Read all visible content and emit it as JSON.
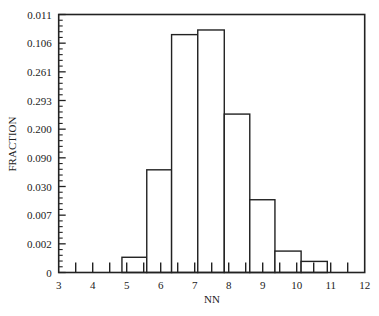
{
  "chart_data": {
    "type": "bar",
    "subtype": "histogram",
    "title": "",
    "xlabel": "NN",
    "ylabel": "FRACTION",
    "xlim": [
      3,
      12
    ],
    "x_ticks": [
      3,
      4,
      5,
      6,
      7,
      8,
      9,
      10,
      11,
      12
    ],
    "x_minor_step": 0.5,
    "y_tick_labels_top_to_bottom": [
      "0.011",
      "0.106",
      "0.261",
      "0.293",
      "0.200",
      "0.090",
      "0.030",
      "0.007",
      "0.002",
      "0"
    ],
    "y_minor_per_major": 4,
    "grid": false,
    "legend": null,
    "bin_edges": [
      4.86,
      5.59,
      6.32,
      7.09,
      7.87,
      8.62,
      9.36,
      10.13,
      10.9
    ],
    "bins": [
      {
        "x0": 4.86,
        "x1": 5.59,
        "height_frac": 0.059
      },
      {
        "x0": 5.59,
        "x1": 6.32,
        "height_frac": 0.398
      },
      {
        "x0": 6.32,
        "x1": 7.09,
        "height_frac": 0.922
      },
      {
        "x0": 7.09,
        "x1": 7.87,
        "height_frac": 0.94
      },
      {
        "x0": 7.87,
        "x1": 8.62,
        "height_frac": 0.614
      },
      {
        "x0": 8.62,
        "x1": 9.36,
        "height_frac": 0.282
      },
      {
        "x0": 9.36,
        "x1": 10.13,
        "height_frac": 0.083
      },
      {
        "x0": 10.13,
        "x1": 10.9,
        "height_frac": 0.043
      }
    ],
    "note_heights": "height_frac is bar height as a fraction of the y-axis span (axis labels are non-monotonic as printed)"
  },
  "layout": {
    "plot": {
      "left": 58.7,
      "right": 364.7,
      "top": 14.5,
      "bottom": 272.5
    },
    "colors": {
      "line": "#222222",
      "bar_fill": "#ffffff",
      "background": "#ffffff"
    }
  }
}
